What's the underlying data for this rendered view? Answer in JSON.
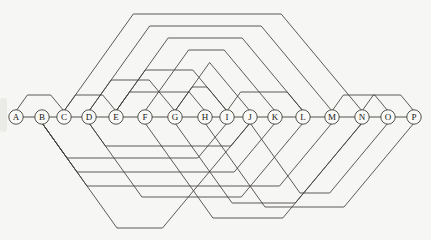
{
  "figure": {
    "width": 431,
    "height": 240,
    "background": "#f6f6f4",
    "line_color": "#413f3b",
    "node_fill": "#f9f9f7",
    "node_stroke": "#413f3b",
    "label_color": "#171614",
    "spine_y": 117,
    "node_radius": 7.2,
    "leg_slope_left": 1.4,
    "leg_slope_right": 1.2
  },
  "nodes": [
    {
      "label": "A",
      "x": 16
    },
    {
      "label": "B",
      "x": 42
    },
    {
      "label": "C",
      "x": 64
    },
    {
      "label": "D",
      "x": 89
    },
    {
      "label": "E",
      "x": 116
    },
    {
      "label": "F",
      "x": 145
    },
    {
      "label": "G",
      "x": 175
    },
    {
      "label": "H",
      "x": 205
    },
    {
      "label": "I",
      "x": 227
    },
    {
      "label": "J",
      "x": 250
    },
    {
      "label": "K",
      "x": 275
    },
    {
      "label": "L",
      "x": 303
    },
    {
      "label": "M",
      "x": 332
    },
    {
      "label": "N",
      "x": 362
    },
    {
      "label": "O",
      "x": 388
    },
    {
      "label": "P",
      "x": 414
    }
  ],
  "spine": {
    "connected": true
  },
  "arcs": [
    {
      "from": "A",
      "to": "C",
      "side": "up",
      "peak": 95
    },
    {
      "from": "C",
      "to": "E",
      "side": "up",
      "peak": 95
    },
    {
      "from": "E",
      "to": "H",
      "side": "up",
      "peak": 92
    },
    {
      "from": "G",
      "to": "I",
      "side": "up",
      "peak": 87
    },
    {
      "from": "I",
      "to": "L",
      "side": "up",
      "peak": 92
    },
    {
      "from": "M",
      "to": "O",
      "side": "up",
      "peak": 95
    },
    {
      "from": "N",
      "to": "P",
      "side": "up",
      "peak": 95
    },
    {
      "from": "C",
      "to": "N",
      "side": "up",
      "peak": 14
    },
    {
      "from": "D",
      "to": "M",
      "side": "up",
      "peak": 26
    },
    {
      "from": "E",
      "to": "L",
      "side": "up",
      "peak": 38
    },
    {
      "from": "F",
      "to": "K",
      "side": "up",
      "peak": 50
    },
    {
      "from": "G",
      "to": "J",
      "side": "up",
      "peak": 62
    },
    {
      "from": "E",
      "to": "I",
      "side": "up",
      "peak": 70
    },
    {
      "from": "D",
      "to": "G",
      "side": "up",
      "peak": 80
    },
    {
      "from": "D",
      "to": "J",
      "side": "down",
      "peak": 146
    },
    {
      "from": "B",
      "to": "I",
      "side": "down",
      "peak": 158
    },
    {
      "from": "B",
      "to": "K",
      "side": "down",
      "peak": 172
    },
    {
      "from": "B",
      "to": "M",
      "side": "down",
      "peak": 186
    },
    {
      "from": "D",
      "to": "L",
      "side": "down",
      "peak": 197
    },
    {
      "from": "J",
      "to": "O",
      "side": "down",
      "peak": 193
    },
    {
      "from": "G",
      "to": "N",
      "side": "down",
      "peak": 203
    },
    {
      "from": "H",
      "to": "P",
      "side": "down",
      "peak": 207
    },
    {
      "from": "F",
      "to": "N",
      "side": "down",
      "peak": 218
    },
    {
      "from": "B",
      "to": "J",
      "side": "down",
      "peak": 228
    }
  ]
}
